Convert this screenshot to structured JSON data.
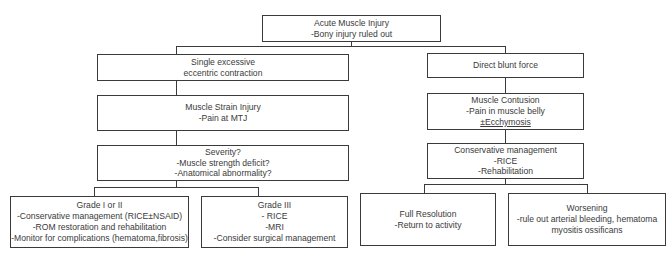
{
  "diagram": {
    "root": {
      "lines": [
        "Acute Muscle Injury",
        "-Bony injury ruled out"
      ]
    },
    "left_branch": {
      "mechanism": {
        "lines": [
          "Single excessive",
          "eccentric contraction"
        ]
      },
      "diagnosis": {
        "lines": [
          "Muscle Strain Injury",
          "-Pain at MTJ"
        ]
      },
      "assessment": {
        "lines": [
          "Severity?",
          "-Muscle strength deficit?",
          "-Anatomical abnormality?"
        ]
      },
      "outcomes": [
        {
          "lines": [
            "Grade I or II",
            "-Conservative management (RICE±NSAID)",
            "-ROM restoration and rehabilitation",
            "-Monitor for complications (hematoma,fibrosis)"
          ]
        },
        {
          "lines": [
            "Grade III",
            "- RICE",
            "-MRI",
            "-Consider surgical management"
          ]
        }
      ]
    },
    "right_branch": {
      "mechanism": {
        "lines": [
          "Direct blunt force"
        ]
      },
      "diagnosis": {
        "lines": [
          "Muscle Contusion",
          "-Pain in muscle belly",
          "±Ecchymosis"
        ]
      },
      "management": {
        "lines": [
          "Conservative management",
          "-RICE",
          "-Rehabilitation"
        ]
      },
      "outcomes": [
        {
          "lines": [
            "Full Resolution",
            "-Return to activity"
          ]
        },
        {
          "lines": [
            "Worsening",
            "-rule out arterial bleeding, hematoma",
            "myositis ossificans"
          ]
        }
      ]
    },
    "colors": {
      "border": "#3a3a3a",
      "text": "#3a3a3a",
      "background": "#ffffff"
    }
  }
}
